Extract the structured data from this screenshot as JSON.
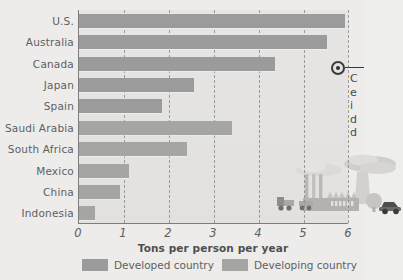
{
  "chart_data": {
    "type": "bar",
    "orientation": "horizontal",
    "title": "",
    "xlabel": "Tons per person per year",
    "ylabel": "",
    "xlim": [
      0,
      6
    ],
    "xticks": [
      0,
      1,
      2,
      3,
      4,
      5,
      6
    ],
    "grid": "vertical-dashed",
    "categories": [
      "U.S.",
      "Australia",
      "Canada",
      "Japan",
      "Spain",
      "Saudi Arabia",
      "South Africa",
      "Mexico",
      "China",
      "Indonesia"
    ],
    "values": [
      5.9,
      5.5,
      4.35,
      2.55,
      1.85,
      3.4,
      2.4,
      1.1,
      0.9,
      0.35
    ],
    "groups": [
      "developed",
      "developed",
      "developed",
      "developed",
      "developed",
      "developing",
      "developing",
      "developing",
      "developing",
      "developing"
    ],
    "legend": {
      "position": "bottom",
      "entries": [
        {
          "label": "Developed country",
          "key": "developed",
          "color": "#9b9b9b"
        },
        {
          "label": "Developing country",
          "key": "developing",
          "color": "#a5a5a3"
        }
      ]
    },
    "annotations": [
      {
        "name": "canada-callout",
        "target_category": "Canada",
        "text": "C\ne\ni\nd\nd",
        "note": "text clipped at image edge"
      }
    ]
  },
  "axis": {
    "tick_0": "0",
    "tick_1": "1",
    "tick_2": "2",
    "tick_3": "3",
    "tick_4": "4",
    "tick_5": "5",
    "tick_6": "6",
    "title": "Tons per person per year"
  },
  "categories": {
    "c0": "U.S.",
    "c1": "Australia",
    "c2": "Canada",
    "c3": "Japan",
    "c4": "Spain",
    "c5": "Saudi Arabia",
    "c6": "South Africa",
    "c7": "Mexico",
    "c8": "China",
    "c9": "Indonesia"
  },
  "legend": {
    "developed": "Developed country",
    "developing": "Developing country"
  },
  "callout": {
    "text": "C\ne\ni\nd\nd"
  },
  "illustration": {
    "name": "factory-smokestacks-vehicles"
  },
  "colors": {
    "bar_developed": "#9b9b9b",
    "bar_developing": "#a5a5a3",
    "background": "#edeceb",
    "plot_background": "#e4e3e1",
    "axis": "#7d7d7d",
    "text": "#5f5f5f"
  }
}
